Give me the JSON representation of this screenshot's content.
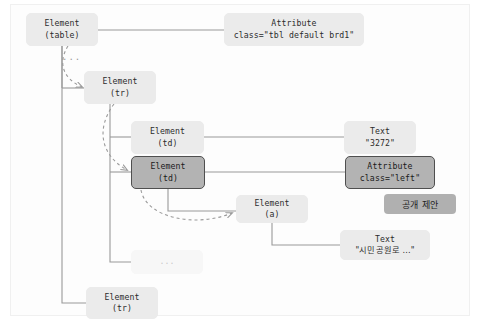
{
  "diagram": {
    "colors": {
      "node_light_bg": "#ebebeb",
      "node_selected_bg": "#b3b3b3",
      "node_selected_border": "#4f4f4f",
      "node_ghost_bg": "#f7f7f7",
      "badge_bg": "#b0b0b0",
      "wire": "#9a9a9a",
      "dashed_arrow": "#9a9a9a",
      "page_bg": "#ffffff"
    },
    "nodes": [
      {
        "id": "element-table",
        "line1": "Element",
        "line2": "(table)",
        "state": "light"
      },
      {
        "id": "attribute-table",
        "line1": "Attribute",
        "line2": "class=\"tbl default brd1\"",
        "state": "light"
      },
      {
        "id": "element-tr-1",
        "line1": "Element",
        "line2": "(tr)",
        "state": "light"
      },
      {
        "id": "element-td-1",
        "line1": "Element",
        "line2": "(td)",
        "state": "light"
      },
      {
        "id": "text-3272",
        "line1": "Text",
        "line2": "\"3272\"",
        "state": "light"
      },
      {
        "id": "element-td-2",
        "line1": "Element",
        "line2": "(td)",
        "state": "selected"
      },
      {
        "id": "attribute-left",
        "line1": "Attribute",
        "line2": "class=\"left\"",
        "state": "selected"
      },
      {
        "id": "element-a",
        "line1": "Element",
        "line2": "(a)",
        "state": "light"
      },
      {
        "id": "text-address",
        "line1": "Text",
        "line2": "\"시민공원로 ...\"",
        "state": "light"
      },
      {
        "id": "ellipsis-node",
        "line1": "...",
        "line2": "",
        "state": "ghost"
      },
      {
        "id": "element-tr-2",
        "line1": "Element",
        "line2": "(tr)",
        "state": "light"
      }
    ],
    "ellipsis_marker": "...",
    "badge": {
      "label": "공개 제안"
    }
  }
}
